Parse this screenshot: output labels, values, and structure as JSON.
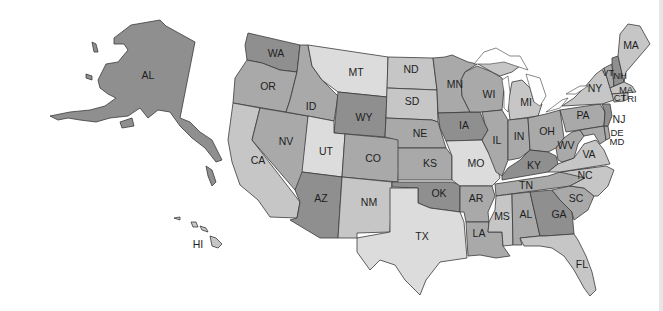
{
  "map": {
    "title": "United States map with state abbreviations",
    "shades": {
      "dark": "#8f8f8f",
      "mid": "#a9a9a9",
      "light": "#c6c6c6",
      "pale": "#dcdcdc",
      "water": "#ffffff",
      "border": "#3a3a3a"
    },
    "states": [
      {
        "abbr": "AL",
        "region": "alaska",
        "shade": "dark"
      },
      {
        "abbr": "HI",
        "shade": "light"
      },
      {
        "abbr": "WA",
        "shade": "dark"
      },
      {
        "abbr": "OR",
        "shade": "mid"
      },
      {
        "abbr": "CA",
        "shade": "light"
      },
      {
        "abbr": "ID",
        "shade": "mid"
      },
      {
        "abbr": "NV",
        "shade": "mid"
      },
      {
        "abbr": "MT",
        "shade": "pale"
      },
      {
        "abbr": "WY",
        "shade": "dark"
      },
      {
        "abbr": "UT",
        "shade": "pale"
      },
      {
        "abbr": "CO",
        "shade": "mid"
      },
      {
        "abbr": "AZ",
        "shade": "dark"
      },
      {
        "abbr": "NM",
        "shade": "light"
      },
      {
        "abbr": "ND",
        "shade": "light"
      },
      {
        "abbr": "SD",
        "shade": "light"
      },
      {
        "abbr": "NE",
        "shade": "mid"
      },
      {
        "abbr": "KS",
        "shade": "mid"
      },
      {
        "abbr": "OK",
        "shade": "dark"
      },
      {
        "abbr": "TX",
        "shade": "pale"
      },
      {
        "abbr": "MN",
        "shade": "mid"
      },
      {
        "abbr": "IA",
        "shade": "dark"
      },
      {
        "abbr": "MO",
        "shade": "pale"
      },
      {
        "abbr": "AR",
        "shade": "mid"
      },
      {
        "abbr": "LA",
        "shade": "mid"
      },
      {
        "abbr": "WI",
        "shade": "mid"
      },
      {
        "abbr": "IL",
        "shade": "mid"
      },
      {
        "abbr": "MI",
        "shade": "light"
      },
      {
        "abbr": "IN",
        "shade": "mid"
      },
      {
        "abbr": "OH",
        "shade": "mid"
      },
      {
        "abbr": "KY",
        "shade": "dark"
      },
      {
        "abbr": "TN",
        "shade": "mid"
      },
      {
        "abbr": "MS",
        "shade": "light"
      },
      {
        "abbr": "AL",
        "region": "alabama",
        "shade": "mid"
      },
      {
        "abbr": "GA",
        "shade": "dark"
      },
      {
        "abbr": "FL",
        "shade": "light"
      },
      {
        "abbr": "SC",
        "shade": "mid"
      },
      {
        "abbr": "NC",
        "shade": "light"
      },
      {
        "abbr": "VA",
        "shade": "light"
      },
      {
        "abbr": "WV",
        "shade": "mid"
      },
      {
        "abbr": "PA",
        "shade": "mid"
      },
      {
        "abbr": "NY",
        "shade": "light"
      },
      {
        "abbr": "NJ",
        "shade": "dark"
      },
      {
        "abbr": "DE",
        "shade": "mid"
      },
      {
        "abbr": "MD",
        "shade": "mid"
      },
      {
        "abbr": "CT",
        "shade": "light"
      },
      {
        "abbr": "RI",
        "shade": "light"
      },
      {
        "abbr": "MA",
        "region": "massachusetts",
        "shade": "light"
      },
      {
        "abbr": "VT",
        "shade": "mid"
      },
      {
        "abbr": "NH",
        "shade": "dark"
      },
      {
        "abbr": "MA",
        "region": "maine",
        "shade": "light"
      }
    ]
  }
}
